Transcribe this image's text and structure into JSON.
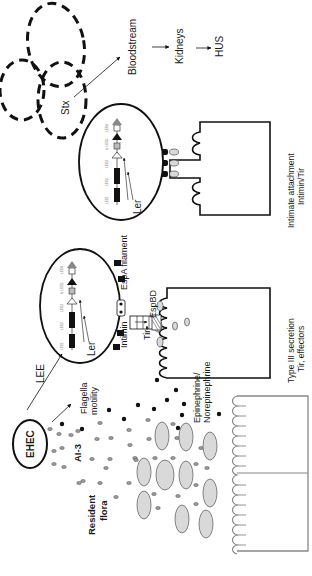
{
  "diagram": {
    "orientation": "rotated 90 degrees counter-clockwise (text reads bottom-to-top)",
    "labels": {
      "ehec": "EHEC",
      "ai3": "AI-3",
      "resident_flora_line1": "Resident",
      "resident_flora_line2": "flora",
      "flagella_line1": "Flagella",
      "flagella_line2": "motility",
      "epinephrine_line1": "Epinephrine/",
      "epinephrine_line2": "Norepinephrine",
      "lee": "LEE",
      "intimin_1": "Intimin",
      "ler_1": "Ler",
      "espa": "EspA filament",
      "espbd": "EspBD",
      "tir": "Tir",
      "type3_line1": "Type III secretion",
      "type3_line2": "Tir, effectors",
      "ler_2": "Ler",
      "intimate_line1": "Intimate attachment",
      "intimate_line2": "Intimin/Tir",
      "stx": "Stx",
      "bloodstream": "Bloodstream",
      "kidneys": "Kidneys",
      "hus": "HUS"
    },
    "operons": [
      "LEE1",
      "LEE2",
      "LEE3",
      "tir",
      "LEE5",
      "LEE4"
    ],
    "colors": {
      "stroke": "#111111",
      "flora_fill": "#d9d9d9",
      "epithelium_stroke": "#888888",
      "background": "#ffffff"
    }
  }
}
